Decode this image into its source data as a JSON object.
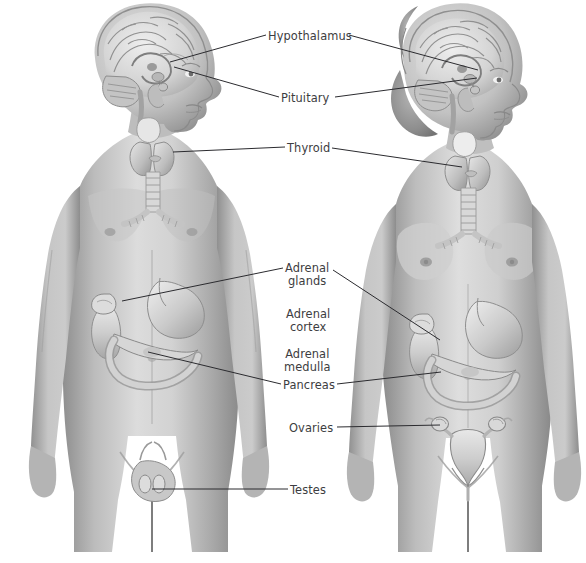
{
  "figure": {
    "background_color": "#ffffff",
    "label_color": "#3d3d41",
    "leader_color": "#2b2b2f",
    "body_tone_light": "#d9d9d9",
    "body_tone_mid": "#a9a9a9",
    "body_tone_dark": "#7d7d7d",
    "organ_tone": "#cfcfcf"
  },
  "figures": [
    {
      "name": "male-figure",
      "sex": "male",
      "view": "anterior with sagittal head section"
    },
    {
      "name": "female-figure",
      "sex": "female",
      "view": "anterior with sagittal head section"
    }
  ],
  "labels": [
    {
      "id": "hypothalamus",
      "text": "Hypothalamus",
      "x": 268,
      "y": 30,
      "align": "left"
    },
    {
      "id": "pituitary",
      "text": "Pituitary",
      "x": 281,
      "y": 92,
      "align": "left"
    },
    {
      "id": "thyroid",
      "text": "Thyroid",
      "x": 287,
      "y": 142,
      "align": "left"
    },
    {
      "id": "adrenal-glands",
      "text": "Adrenal\nglands",
      "x": 285,
      "y": 262,
      "align": "center"
    },
    {
      "id": "adrenal-cortex",
      "text": "Adrenal\ncortex",
      "x": 286,
      "y": 308,
      "align": "center"
    },
    {
      "id": "adrenal-medulla",
      "text": "Adrenal\nmedulla",
      "x": 284,
      "y": 348,
      "align": "center"
    },
    {
      "id": "pancreas",
      "text": "Pancreas",
      "x": 283,
      "y": 379,
      "align": "left"
    },
    {
      "id": "ovaries",
      "text": "Ovaries",
      "x": 289,
      "y": 422,
      "align": "left"
    },
    {
      "id": "testes",
      "text": "Testes",
      "x": 290,
      "y": 484,
      "align": "left"
    }
  ],
  "label_lines": [
    {
      "id": "hypothalamus-male",
      "from": [
        266,
        35
      ],
      "to": [
        170,
        62
      ]
    },
    {
      "id": "hypothalamus-female",
      "from": [
        349,
        35
      ],
      "to": [
        478,
        70
      ]
    },
    {
      "id": "pituitary-male",
      "from": [
        279,
        97
      ],
      "to": [
        174,
        67
      ]
    },
    {
      "id": "pituitary-female",
      "from": [
        335,
        97
      ],
      "to": [
        477,
        78
      ]
    },
    {
      "id": "thyroid-male",
      "from": [
        285,
        147
      ],
      "to": [
        173,
        152
      ]
    },
    {
      "id": "thyroid-female",
      "from": [
        332,
        148
      ],
      "to": [
        462,
        167
      ]
    },
    {
      "id": "adrenal-male",
      "from": [
        283,
        268
      ],
      "to": [
        122,
        301
      ]
    },
    {
      "id": "adrenal-female",
      "from": [
        333,
        270
      ],
      "to": [
        440,
        340
      ]
    },
    {
      "id": "pancreas-male",
      "from": [
        281,
        384
      ],
      "to": [
        148,
        352
      ]
    },
    {
      "id": "pancreas-female",
      "from": [
        337,
        384
      ],
      "to": [
        441,
        372
      ]
    },
    {
      "id": "ovaries-female",
      "from": [
        337,
        427
      ],
      "to": [
        440,
        425
      ]
    },
    {
      "id": "testes-male",
      "from": [
        288,
        489
      ],
      "to": [
        152,
        489
      ]
    }
  ]
}
